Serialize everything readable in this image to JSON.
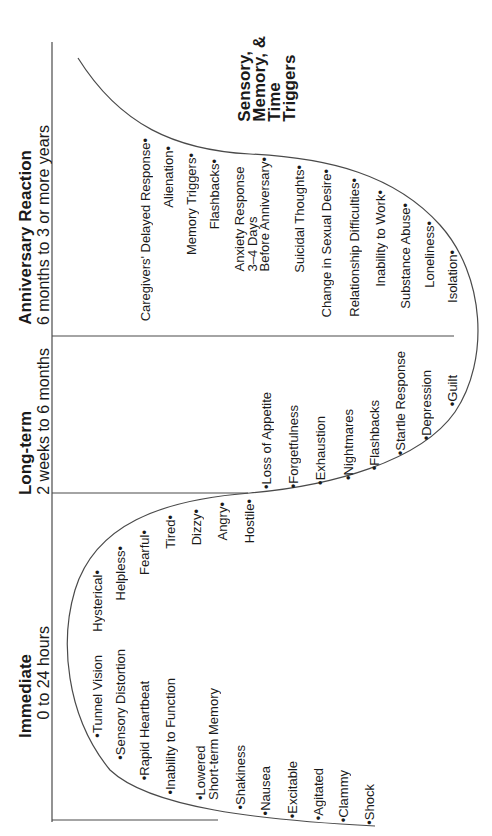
{
  "diagram": {
    "orientation": "rotated 90deg counter-clockwise",
    "line_color": "#4a4a4a",
    "text_color": "#1a1a1a",
    "phases": [
      {
        "title": "Immediate",
        "subtitle": "0 to 24 hours",
        "symptoms_below_curve": [
          "Tunnel Vision",
          "Sensory Distortion",
          "Rapid Heartbeat",
          "Inability to Function",
          "Lowered\nShort-term Memory",
          "Shakiness",
          "Nausea",
          "Excitable",
          "Agitated",
          "Clammy",
          "Shock"
        ],
        "symptoms_above_curve": [
          "Hysterical",
          "Helpless",
          "Fearful",
          "Tired",
          "Dizzy",
          "Angry",
          "Hostile"
        ]
      },
      {
        "title": "Long-term",
        "subtitle": "2 weeks to 6 months",
        "symptoms": [
          "Loss of Appetite",
          "Forgetfulness",
          "Exhaustion",
          "Nightmares",
          "Flashbacks",
          "Startle Response",
          "Depression",
          "Guilt"
        ]
      },
      {
        "title": "Anniversary Reaction",
        "subtitle": "6 months to 3 or more years",
        "symptoms": [
          "Caregivers' Delayed Response",
          "Alienation",
          "Memory Triggers",
          "Flashbacks",
          "Anxiety Response\n3–4 Days\nBefore Anniversary",
          "Suicidal Thoughts",
          "Change in Sexual Desire",
          "Relationship Difficulties",
          "Inability to Work",
          "Substance Abuse",
          "Loneliness",
          "Isolation"
        ]
      }
    ],
    "triggers_label": "Sensory,\nMemory, &\nTime\nTriggers",
    "bullet": "•"
  }
}
